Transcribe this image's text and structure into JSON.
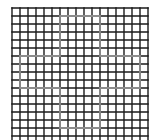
{
  "figure": {
    "type": "grid-with-outlined-shape"
  },
  "grid": {
    "origin_x": 12,
    "origin_y": 8,
    "cell_size": 8,
    "columns": 17,
    "rows": 17,
    "line_color": "#1a1a1a",
    "line_width": 1.4,
    "background": "#ffffff"
  },
  "shape": {
    "name": "plus-outline",
    "color": "#8c8c8c",
    "line_width": 1.8,
    "vertical_arm": {
      "x0": 6,
      "x1": 11,
      "y0": 1,
      "y1": 15
    },
    "horizontal_arm": {
      "x0": 1,
      "x1": 16,
      "y0": 6,
      "y1": 10
    }
  },
  "colors": {
    "grid": "#1a1a1a",
    "shape": "#8c8c8c",
    "background": "#ffffff"
  }
}
